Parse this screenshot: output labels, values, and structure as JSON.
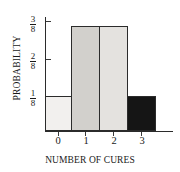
{
  "chart_data": {
    "type": "bar",
    "title": "",
    "xlabel": "NUMBER OF CURES",
    "ylabel": "PROBABILITY",
    "categories": [
      "0",
      "1",
      "2",
      "3"
    ],
    "values": [
      0.125,
      0.375,
      0.375,
      0.125
    ],
    "value_labels": [
      "1/8",
      "3/8",
      "3/8",
      "1/8"
    ],
    "ylim": [
      0,
      0.40625
    ],
    "grid": false,
    "legend": null,
    "ytick_values": [
      0.125,
      0.25,
      0.375
    ],
    "ytick_labels": [
      {
        "numerator": "1",
        "denominator": "8"
      },
      {
        "numerator": "2",
        "denominator": "8"
      },
      {
        "numerator": "3",
        "denominator": "8"
      }
    ],
    "bars": [
      {
        "category": "0",
        "value": 0.125,
        "label": "1/8",
        "fill": "#f2f0ee",
        "edge": "#2b2b2b"
      },
      {
        "category": "1",
        "value": 0.375,
        "label": "3/8",
        "fill": "#d2d0cc",
        "edge": "#2b2b2b"
      },
      {
        "category": "2",
        "value": 0.375,
        "label": "3/8",
        "fill": "#e4e2df",
        "edge": "#2b2b2b"
      },
      {
        "category": "3",
        "value": 0.125,
        "label": "1/8",
        "fill": "#151515",
        "edge": "#2b2b2b"
      }
    ]
  },
  "axes": {
    "y_title": "PROBABILITY",
    "x_title": "NUMBER OF CURES"
  },
  "colors": {
    "axis": "#2b2b2b",
    "text": "#1a1a1a",
    "background": "#ffffff"
  }
}
